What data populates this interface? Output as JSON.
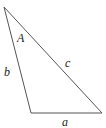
{
  "diagram": {
    "type": "triangle",
    "stroke_color": "#555555",
    "vertices": {
      "top": [
        4,
        7
      ],
      "bottom_left": [
        31,
        113
      ],
      "bottom_right": [
        102,
        113
      ]
    },
    "labels": {
      "angle_A": "A",
      "side_a": "a",
      "side_b": "b",
      "side_c": "c"
    }
  }
}
